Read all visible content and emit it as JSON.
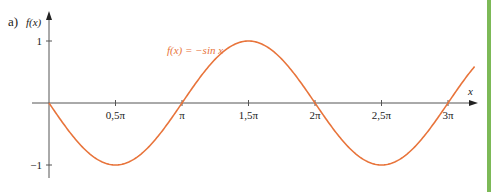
{
  "panel_label": "a)",
  "chart_data": {
    "type": "line",
    "title": "",
    "function_label": "f(x) = −sin x",
    "xlabel": "x",
    "ylabel": "f(x)",
    "x_ticks": [
      {
        "value": 0.5,
        "label": "0,5π"
      },
      {
        "value": 1.0,
        "label": "π"
      },
      {
        "value": 1.5,
        "label": "1,5π"
      },
      {
        "value": 2.0,
        "label": "2π"
      },
      {
        "value": 2.5,
        "label": "2,5π"
      },
      {
        "value": 3.0,
        "label": "3π"
      }
    ],
    "y_ticks": [
      {
        "value": 1,
        "label": "1"
      },
      {
        "value": -1,
        "label": "−1"
      }
    ],
    "x_unit": "π",
    "xlim": [
      0,
      3.2
    ],
    "ylim": [
      -1,
      1
    ],
    "grid": false,
    "series": [
      {
        "name": "f(x) = −sin x",
        "color": "#e8743b",
        "x": [
          0,
          0.25,
          0.5,
          0.75,
          1.0,
          1.25,
          1.5,
          1.75,
          2.0,
          2.25,
          2.5,
          2.75,
          3.0,
          3.2
        ],
        "values": [
          0,
          -0.707,
          -1,
          -0.707,
          0,
          0.707,
          1,
          0.707,
          0,
          -0.707,
          -1,
          -0.707,
          0,
          0.588
        ]
      }
    ],
    "colors": {
      "curve": "#e8743b",
      "axis": "#555555",
      "accent_bar": "#7cb957"
    }
  }
}
